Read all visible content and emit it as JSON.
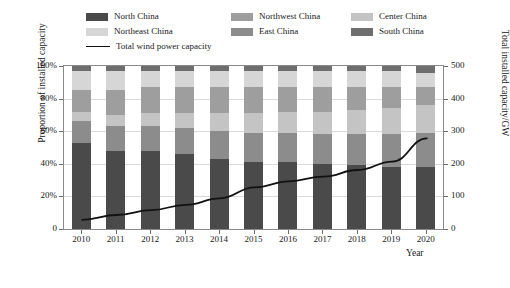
{
  "chart_data": {
    "type": "bar",
    "title": "",
    "xlabel": "Year",
    "ylabel": "Proportion of installed capacity",
    "ylabel_right": "Total installed capacity/GW",
    "categories": [
      "2010",
      "2011",
      "2012",
      "2013",
      "2014",
      "2015",
      "2016",
      "2017",
      "2018",
      "2019",
      "2020"
    ],
    "ylim": [
      0,
      100
    ],
    "ytick_labels": [
      "0",
      "20%",
      "40%",
      "60%",
      "80%",
      "100%"
    ],
    "ytick_values": [
      0,
      20,
      40,
      60,
      80,
      100
    ],
    "ylim_right": [
      0,
      500
    ],
    "ytick_labels_right": [
      "0",
      "100",
      "200",
      "300",
      "400",
      "500"
    ],
    "ytick_values_right": [
      0,
      100,
      200,
      300,
      400,
      500
    ],
    "grid": true,
    "legend_position": "top",
    "stacking": "percent",
    "series": [
      {
        "name": "North China",
        "color": "#4a4a4a",
        "values": [
          53,
          48,
          48,
          46,
          43,
          41,
          41,
          40,
          39,
          38,
          38
        ]
      },
      {
        "name": "East China",
        "color": "#8c8c8c",
        "values": [
          13,
          15,
          15,
          16,
          17,
          18,
          18,
          18,
          19,
          20,
          21
        ]
      },
      {
        "name": "Center China",
        "color": "#c4c4c4",
        "values": [
          6,
          7,
          8,
          9,
          11,
          12,
          13,
          14,
          15,
          16,
          17
        ]
      },
      {
        "name": "Northwest China",
        "color": "#9e9e9e",
        "values": [
          13,
          15,
          16,
          16,
          16,
          16,
          15,
          15,
          14,
          13,
          11
        ]
      },
      {
        "name": "Northeast China",
        "color": "#d6d6d6",
        "values": [
          12,
          12,
          10,
          10,
          10,
          10,
          10,
          10,
          10,
          10,
          9
        ]
      },
      {
        "name": "South China",
        "color": "#6e6e6e",
        "values": [
          3,
          3,
          3,
          3,
          3,
          3,
          3,
          3,
          3,
          3,
          4
        ]
      }
    ],
    "line_series": {
      "name": "Total wind power capacity",
      "color": "#111111",
      "unit": "GW",
      "axis": "right",
      "values": [
        31,
        46,
        61,
        77,
        97,
        131,
        149,
        164,
        184,
        210,
        281
      ]
    }
  },
  "legend": {
    "items": [
      {
        "label": "North China",
        "color": "#4a4a4a",
        "type": "swatch"
      },
      {
        "label": "Northeast China",
        "color": "#d6d6d6",
        "type": "swatch"
      },
      {
        "label": "Northwest China",
        "color": "#9e9e9e",
        "type": "swatch"
      },
      {
        "label": "East China",
        "color": "#8c8c8c",
        "type": "swatch"
      },
      {
        "label": "Center China",
        "color": "#c4c4c4",
        "type": "swatch"
      },
      {
        "label": "South China",
        "color": "#6e6e6e",
        "type": "swatch"
      },
      {
        "label": "Total wind power capacity",
        "color": "#111111",
        "type": "line"
      }
    ]
  }
}
